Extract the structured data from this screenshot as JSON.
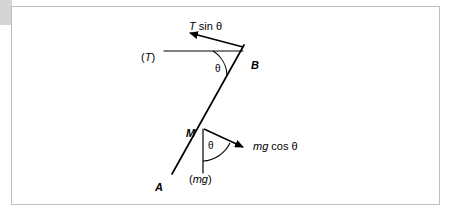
{
  "figure": {
    "background_color": "#ffffff",
    "frame_color": "#bfbfbf",
    "stroke_color": "#000000",
    "accent_block_color": "#d5d5d5"
  },
  "points": [
    {
      "id": "A",
      "label": "A",
      "x": 155,
      "y": 182
    },
    {
      "id": "B",
      "label": "B",
      "x": 251,
      "y": 60
    },
    {
      "id": "M",
      "label": "M",
      "x": 186,
      "y": 128
    }
  ],
  "vectors": [
    {
      "id": "t-sin-theta",
      "label_italic": "T",
      "label_rest": " sin θ",
      "label_x": 189,
      "label_y": 21,
      "from_x": 243,
      "from_y": 47,
      "to_x": 190,
      "to_y": 33
    },
    {
      "id": "mg-cos-theta",
      "label_italic": "mg",
      "label_rest": " cos θ",
      "label_x": 253,
      "label_y": 141,
      "from_x": 204,
      "from_y": 129,
      "to_x": 243,
      "to_y": 147
    }
  ],
  "scalar_labels": [
    {
      "id": "tension",
      "text": "(T)",
      "italic_part": "T",
      "x": 141,
      "y": 52
    },
    {
      "id": "weight",
      "text": "(mg)",
      "italic_part": "mg",
      "x": 189,
      "y": 174
    }
  ],
  "angles": [
    {
      "id": "theta-at-b",
      "symbol": "θ",
      "x": 215,
      "y": 64
    },
    {
      "id": "theta-at-m",
      "symbol": "θ",
      "x": 208,
      "y": 141
    }
  ],
  "lines": [
    {
      "id": "string-ab",
      "from_x": 172,
      "from_y": 174,
      "to_x": 244,
      "to_y": 45
    },
    {
      "id": "horizontal-at-b",
      "from_x": 164,
      "from_y": 51,
      "to_x": 243,
      "to_y": 51
    },
    {
      "id": "vertical-at-m",
      "from_x": 203,
      "from_y": 129,
      "to_x": 203,
      "to_y": 173
    }
  ]
}
